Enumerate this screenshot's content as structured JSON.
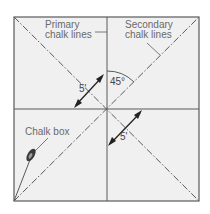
{
  "diagram": {
    "labels": {
      "primary_line1": "Primary",
      "primary_line2": "chalk lines",
      "secondary_line1": "Secondary",
      "secondary_line2": "chalk lines",
      "angle": "45°",
      "offset_upper": "5'",
      "offset_lower": "5'",
      "chalk_box": "Chalk box"
    },
    "colors": {
      "background": "#ffffff",
      "panel": "#f0f0f0",
      "line": "#5a5a5a",
      "text": "#6a6a6a"
    },
    "icons": [
      "chalk-box-icon",
      "double-arrow-icon",
      "angle-arc-icon"
    ]
  }
}
